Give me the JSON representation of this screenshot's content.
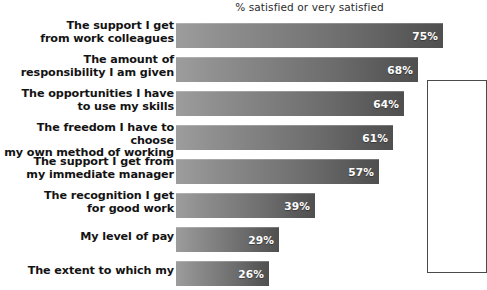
{
  "chart_data": {
    "type": "bar",
    "title": "% satisfied or very satisfied",
    "xlabel": "",
    "ylabel": "",
    "orientation": "horizontal",
    "xlim": [
      0,
      100
    ],
    "grid": false,
    "legend": null,
    "value_suffix": "%",
    "categories": [
      "The support I get\nfrom work colleagues",
      "The amount of\nresponsibility I am given",
      "The opportunities I have\nto use my skills",
      "The freedom I have to choose\nmy own method of working",
      "The support I get from\nmy immediate manager",
      "The recognition I get\nfor good work",
      "My level of pay",
      "The extent to which my"
    ],
    "values": [
      75,
      68,
      64,
      61,
      57,
      39,
      29,
      26
    ]
  },
  "rows": [
    {
      "label_line1": "The support I get",
      "label_line2": "from work colleagues",
      "value": 75,
      "value_label": "75%"
    },
    {
      "label_line1": "The amount of",
      "label_line2": "responsibility I am given",
      "value": 68,
      "value_label": "68%"
    },
    {
      "label_line1": "The opportunities I have",
      "label_line2": "to use my skills",
      "value": 64,
      "value_label": "64%"
    },
    {
      "label_line1": "The freedom I have to choose",
      "label_line2": "my own method of working",
      "value": 61,
      "value_label": "61%"
    },
    {
      "label_line1": "The support I get from",
      "label_line2": "my immediate manager",
      "value": 57,
      "value_label": "57%"
    },
    {
      "label_line1": "The recognition I get",
      "label_line2": "for good work",
      "value": 39,
      "value_label": "39%"
    },
    {
      "label_line1": "My level of pay",
      "label_line2": "",
      "value": 29,
      "value_label": "29%"
    },
    {
      "label_line1": "The extent to which my",
      "label_line2": "",
      "value": 26,
      "value_label": "26%"
    }
  ],
  "colors": {
    "bar_gradient_start": "#9d9d9d",
    "bar_gradient_end": "#4f4f4f",
    "value_text": "#ffffff",
    "category_text": "#131313",
    "title_text": "#2b2b2b",
    "background": "#ffffff",
    "side_box_border": "#4a4a4a"
  }
}
